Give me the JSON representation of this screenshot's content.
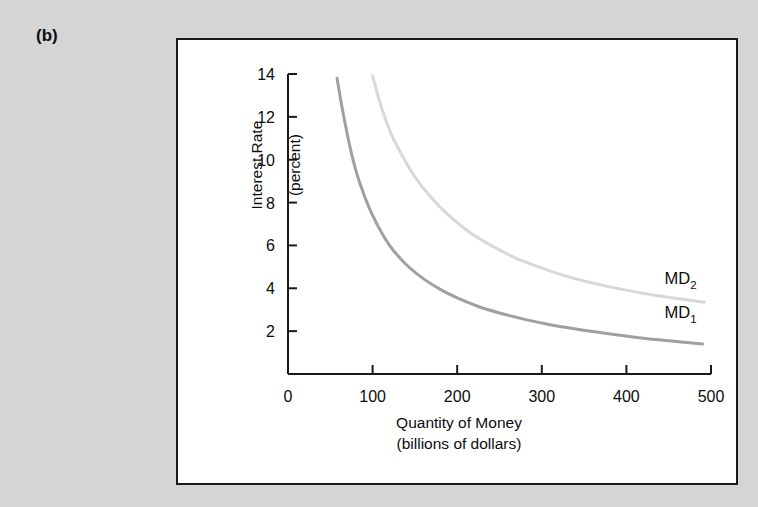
{
  "figure": {
    "panel_label": "(b)",
    "background_color": "#d5d5d5",
    "panel_background": "#ffffff",
    "panel_border_color": "#1a1a1a"
  },
  "chart_data": {
    "type": "line",
    "title": "",
    "xlabel": "Quantity of Money",
    "xlabel_line2": "(billions of dollars)",
    "ylabel": "Interest Rate",
    "ylabel_line2": "(percent)",
    "xlim": [
      0,
      500
    ],
    "ylim": [
      0,
      14
    ],
    "xticks": [
      0,
      100,
      200,
      300,
      400,
      500
    ],
    "xticklabels": [
      "0",
      "100",
      "200",
      "300",
      "400",
      "500"
    ],
    "yticks": [
      2,
      4,
      6,
      8,
      10,
      12,
      14
    ],
    "yticklabels": [
      "2",
      "4",
      "6",
      "8",
      "10",
      "12",
      "14"
    ],
    "grid": false,
    "legend_position": "inline-right",
    "series": [
      {
        "name": "MD1",
        "label": "MD",
        "subscript": "1",
        "color": "#a0a0a0",
        "line_width": 3.0,
        "label_x": 445,
        "label_y": 2.6,
        "x": [
          58,
          65,
          75,
          85,
          100,
          120,
          140,
          160,
          180,
          200,
          225,
          250,
          280,
          310,
          340,
          375,
          410,
          450,
          490
        ],
        "y": [
          13.8,
          12.2,
          10.3,
          8.9,
          7.4,
          6.0,
          5.1,
          4.45,
          3.95,
          3.55,
          3.15,
          2.85,
          2.55,
          2.3,
          2.1,
          1.9,
          1.72,
          1.55,
          1.4
        ]
      },
      {
        "name": "MD2",
        "label": "MD",
        "subscript": "2",
        "color": "#d8d8d8",
        "line_width": 3.0,
        "label_x": 445,
        "label_y": 4.2,
        "x": [
          100,
          110,
          122,
          135,
          150,
          170,
          190,
          215,
          240,
          270,
          300,
          330,
          360,
          395,
          430,
          465,
          492
        ],
        "y": [
          13.9,
          12.5,
          11.2,
          10.2,
          9.2,
          8.2,
          7.4,
          6.6,
          6.0,
          5.4,
          4.95,
          4.55,
          4.25,
          3.95,
          3.7,
          3.5,
          3.35
        ]
      }
    ]
  }
}
